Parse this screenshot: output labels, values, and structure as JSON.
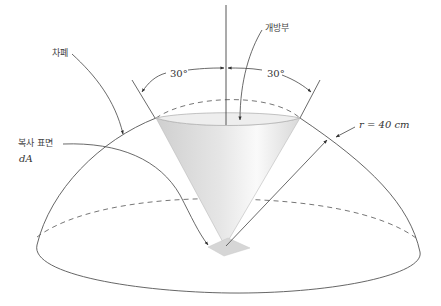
{
  "diagram": {
    "labels": {
      "shield": "차폐",
      "opening": "개방부",
      "angle_left": "30°",
      "angle_right": "30°",
      "radius": "r = 40 cm",
      "radiating_surface": "복사 표면",
      "area_element": "dA"
    },
    "colors": {
      "line": "#555555",
      "dash": "#666666",
      "cone_fill": "#dcdcdc",
      "patch_fill": "#d6d6d6"
    },
    "values": {
      "half_angle_deg": 30,
      "radius_cm": 40
    }
  }
}
